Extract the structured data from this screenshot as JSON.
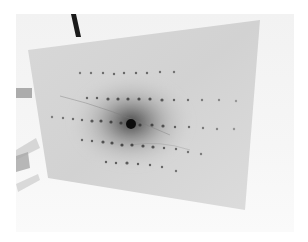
{
  "image": {
    "description": "Photograph of a diffraction pattern on a film/screen",
    "width": 308,
    "height": 242
  },
  "colors": {
    "background": "#ffffff",
    "surround": "#f3f3f3",
    "screen": "#d6d6d6",
    "halo": "#5a5a5a",
    "beam_center": "#111111",
    "spot": "#3a3a3a",
    "support_rod": "#1a1a1a",
    "left_object": "#b8b8b8"
  },
  "screen": {
    "corners": [
      [
        28,
        50
      ],
      [
        260,
        20
      ],
      [
        245,
        210
      ],
      [
        48,
        178
      ]
    ]
  },
  "beam_center": {
    "x": 131,
    "y": 124,
    "r": 5
  },
  "spot_rows": [
    {
      "row": "top",
      "spots": [
        [
          80,
          73
        ],
        [
          91,
          73
        ],
        [
          103,
          73
        ],
        [
          114,
          74
        ],
        [
          124,
          73
        ],
        [
          136,
          73
        ],
        [
          147,
          73
        ],
        [
          160,
          72
        ],
        [
          174,
          72
        ]
      ]
    },
    {
      "row": "upper",
      "spots": [
        [
          87,
          98
        ],
        [
          97,
          98
        ],
        [
          108,
          99
        ],
        [
          118,
          99
        ],
        [
          128,
          99
        ],
        [
          139,
          99
        ],
        [
          150,
          99
        ],
        [
          162,
          100
        ],
        [
          174,
          100
        ],
        [
          188,
          100
        ],
        [
          202,
          100
        ],
        [
          219,
          100
        ],
        [
          236,
          101
        ]
      ]
    },
    {
      "row": "middle",
      "spots": [
        [
          52,
          117
        ],
        [
          63,
          118
        ],
        [
          73,
          119
        ],
        [
          82,
          120
        ],
        [
          92,
          121
        ],
        [
          101,
          121
        ],
        [
          111,
          122
        ],
        [
          121,
          123
        ],
        [
          140,
          125
        ],
        [
          152,
          125
        ],
        [
          163,
          126
        ],
        [
          175,
          127
        ],
        [
          189,
          127
        ],
        [
          203,
          128
        ],
        [
          217,
          129
        ],
        [
          234,
          129
        ]
      ]
    },
    {
      "row": "lower",
      "spots": [
        [
          82,
          140
        ],
        [
          92,
          141
        ],
        [
          103,
          142
        ],
        [
          112,
          143
        ],
        [
          122,
          145
        ],
        [
          132,
          145
        ],
        [
          143,
          146
        ],
        [
          153,
          147
        ],
        [
          164,
          148
        ],
        [
          176,
          149
        ],
        [
          188,
          152
        ],
        [
          201,
          154
        ]
      ]
    },
    {
      "row": "bottom",
      "spots": [
        [
          106,
          162
        ],
        [
          116,
          163
        ],
        [
          127,
          163
        ],
        [
          138,
          164
        ],
        [
          150,
          165
        ],
        [
          162,
          167
        ],
        [
          176,
          171
        ]
      ]
    }
  ]
}
